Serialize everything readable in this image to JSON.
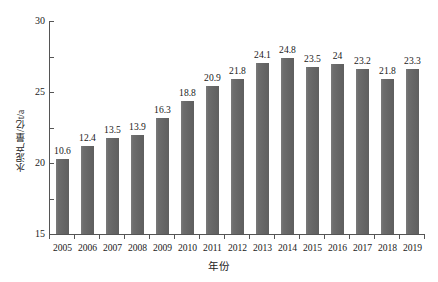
{
  "chart_data": {
    "type": "bar",
    "title": "",
    "xlabel": "年份",
    "ylabel": "水泥产量/亿t/a",
    "categories": [
      "2005",
      "2006",
      "2007",
      "2008",
      "2009",
      "2010",
      "2011",
      "2012",
      "2013",
      "2014",
      "2015",
      "2016",
      "2017",
      "2018",
      "2019"
    ],
    "values": [
      10.6,
      12.4,
      13.5,
      13.9,
      16.3,
      18.8,
      20.9,
      21.8,
      24.1,
      24.8,
      23.5,
      24,
      23.2,
      21.8,
      23.3
    ],
    "value_labels": [
      "10.6",
      "12.4",
      "13.5",
      "13.9",
      "16.3",
      "18.8",
      "20.9",
      "21.8",
      "24.1",
      "24.8",
      "23.5",
      "24",
      "23.2",
      "21.8",
      "23.3"
    ],
    "ylim": [
      0,
      30
    ],
    "yticks": [
      0,
      5,
      10,
      15,
      20,
      25,
      30
    ],
    "ytick_labels": [
      "0",
      "5",
      "10",
      "15",
      "20",
      "25",
      "30"
    ],
    "grid": false,
    "legend": false,
    "series_color": "#6b6b6b",
    "axis_color": "#555555",
    "text_color": "#1a1a1a",
    "background": "#ffffff"
  }
}
